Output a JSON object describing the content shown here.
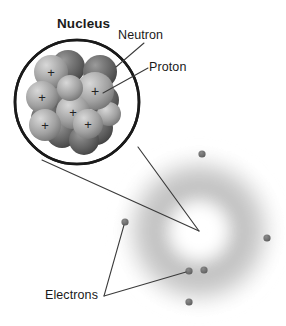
{
  "figure": {
    "background_color": "#ffffff",
    "width": 286,
    "height": 326
  },
  "labels": {
    "nucleus": "Nucleus",
    "neutron": "Neutron",
    "proton": "Proton",
    "electrons": "Electrons"
  },
  "colors": {
    "outline": "#1a1a1a",
    "leader_line": "#3a3a3a",
    "proton_light": "#b9b9b9",
    "proton_mid": "#9a9a9a",
    "proton_dark": "#6e6e6e",
    "neutron_light": "#8c8c8c",
    "neutron_mid": "#6d6d6d",
    "neutron_dark": "#454545",
    "electron_dot": "#6b6b6b",
    "cloud_gray": "#bdbdbd",
    "text": "#1a1a1a"
  },
  "nucleus": {
    "circle": {
      "cx": 77,
      "cy": 102,
      "r": 62,
      "stroke_width": 2.6
    },
    "proton_charge_symbol": "+",
    "proton_count_visible": 7,
    "neutron_count_visible": 8,
    "particles": [
      {
        "type": "neutron",
        "cx": 68,
        "cy": 67,
        "r": 17,
        "charge": ""
      },
      {
        "type": "neutron",
        "cx": 100,
        "cy": 72,
        "r": 17,
        "charge": ""
      },
      {
        "type": "neutron",
        "cx": 64,
        "cy": 96,
        "r": 17,
        "charge": ""
      },
      {
        "type": "neutron",
        "cx": 96,
        "cy": 128,
        "r": 17,
        "charge": ""
      },
      {
        "type": "neutron",
        "cx": 62,
        "cy": 132,
        "r": 16,
        "charge": ""
      },
      {
        "type": "neutron",
        "cx": 104,
        "cy": 100,
        "r": 15,
        "charge": ""
      },
      {
        "type": "neutron",
        "cx": 46,
        "cy": 118,
        "r": 15,
        "charge": ""
      },
      {
        "type": "neutron",
        "cx": 84,
        "cy": 140,
        "r": 15,
        "charge": ""
      },
      {
        "type": "proton",
        "cx": 51,
        "cy": 72,
        "r": 17,
        "charge": "+"
      },
      {
        "type": "proton",
        "cx": 42,
        "cy": 97,
        "r": 16,
        "charge": "+"
      },
      {
        "type": "proton",
        "cx": 95,
        "cy": 91,
        "r": 19,
        "charge": "+"
      },
      {
        "type": "proton",
        "cx": 73,
        "cy": 112,
        "r": 17,
        "charge": "+"
      },
      {
        "type": "proton",
        "cx": 45,
        "cy": 125,
        "r": 16,
        "charge": "+"
      },
      {
        "type": "proton",
        "cx": 88,
        "cy": 124,
        "r": 15,
        "charge": "+"
      },
      {
        "type": "proton",
        "cx": 109,
        "cy": 114,
        "r": 12,
        "charge": "+"
      }
    ]
  },
  "atom": {
    "cloud": {
      "cx": 199,
      "cy": 231,
      "outer_r": 88,
      "ring_peak_r": 58,
      "ring_inner_r": 30
    },
    "nucleus_point": {
      "x": 199,
      "y": 231
    },
    "electrons": [
      {
        "id": "electron-top",
        "cx": 202,
        "cy": 154,
        "r": 3.6
      },
      {
        "id": "electron-right",
        "cx": 267,
        "cy": 238,
        "r": 3.6
      },
      {
        "id": "electron-left",
        "cx": 125,
        "cy": 222,
        "r": 3.6
      },
      {
        "id": "electron-bottom-a",
        "cx": 189,
        "cy": 271,
        "r": 3.6
      },
      {
        "id": "electron-bottom-b",
        "cx": 204,
        "cy": 270,
        "r": 3.6
      },
      {
        "id": "electron-bottom-far",
        "cx": 189,
        "cy": 302,
        "r": 3.6
      }
    ]
  },
  "leader_lines": [
    {
      "name": "magnifier-line-upper",
      "points": "42,160 199,231"
    },
    {
      "name": "magnifier-line-lower",
      "points": "138,147 199,231"
    },
    {
      "name": "neutron-leader",
      "points": "143,44 117,66"
    },
    {
      "name": "proton-leader",
      "points": "147,68 104,93"
    },
    {
      "name": "electrons-leader-left",
      "points": "104,296 125,224"
    },
    {
      "name": "electrons-leader-bottom",
      "points": "104,296 187,272"
    }
  ]
}
